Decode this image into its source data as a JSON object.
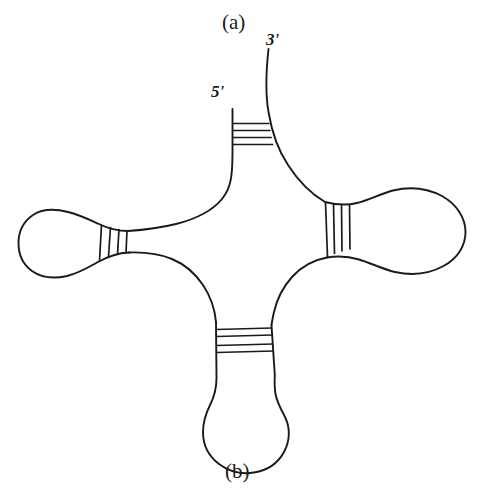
{
  "figure": {
    "kind": "rna-cloverleaf-secondary-structure",
    "background_color": "#ffffff",
    "stroke_color": "#1a1a1a",
    "panel_labels": {
      "top": "(a)",
      "bottom": "(b)"
    },
    "terminus_labels": {
      "five_prime": "5'",
      "three_prime": "3'"
    },
    "arms": [
      {
        "name": "acceptor-stem",
        "position": "top",
        "rung_count": 4,
        "rung_orientation": "horizontal",
        "has_loop": false,
        "termini": [
          "5'",
          "3'"
        ]
      },
      {
        "name": "left-arm",
        "position": "left",
        "rung_count": 4,
        "rung_orientation": "vertical",
        "has_loop": true,
        "loop_shape": "bulb"
      },
      {
        "name": "right-arm",
        "position": "right",
        "rung_count": 4,
        "rung_orientation": "vertical",
        "has_loop": true,
        "loop_shape": "bulb"
      },
      {
        "name": "bottom-arm",
        "position": "bottom",
        "rung_count": 4,
        "rung_orientation": "horizontal",
        "has_loop": true,
        "loop_shape": "elongated-u"
      }
    ]
  }
}
